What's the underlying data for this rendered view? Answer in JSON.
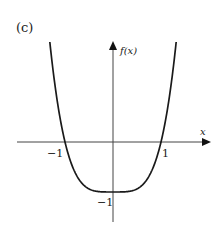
{
  "figure": {
    "panel_label": "(c)",
    "x_axis_label": "x",
    "y_axis_label": "f(x)",
    "x_tick_labels": [
      "−1",
      "1"
    ],
    "y_tick_labels": [
      "−1"
    ],
    "colors": {
      "curve": "#1a1a1a",
      "axis": "#444444",
      "background": "#ffffff"
    }
  },
  "chart_data": {
    "type": "line",
    "title": "(c)",
    "xlabel": "x",
    "ylabel": "f(x)",
    "function": "f(x) = x^4 - 1 (approx.)",
    "x": [
      -1.35,
      -1.2,
      -1.0,
      -0.8,
      -0.5,
      0,
      0.5,
      0.8,
      1.0,
      1.2,
      1.35
    ],
    "series": [
      {
        "name": "f(x)",
        "values": [
          2.32,
          1.07,
          0,
          -0.59,
          -0.94,
          -1,
          -0.94,
          -0.59,
          0,
          1.07,
          2.32
        ]
      }
    ],
    "key_points": {
      "x_intercepts": [
        -1,
        1
      ],
      "y_intercept": -1,
      "minimum": [
        0,
        -1
      ]
    },
    "grid": false
  }
}
